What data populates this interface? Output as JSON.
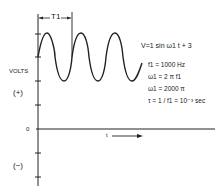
{
  "diagram": {
    "title_equation": "V=1 sin ω1 t + 3",
    "period_label": "T1",
    "y_axis_label": "VOLTS",
    "positive_label": "(+)",
    "negative_label": "(−)",
    "zero_label": "0",
    "x_axis_label": "t",
    "parameters": [
      "f1 = 1000 Hz",
      "ω1 = 2 π f1",
      "ω1 = 2000 π",
      "τ = 1 / f1 = 10⁻³ sec"
    ],
    "wave": {
      "amplitude": 1,
      "offset": 3,
      "cycles": 3,
      "frequency_hz": 1000
    },
    "line_color": "#222222"
  }
}
